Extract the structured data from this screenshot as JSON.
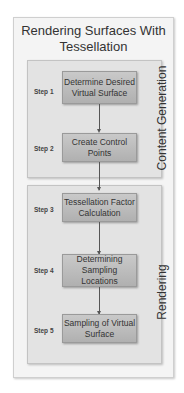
{
  "title": "Rendering Surfaces With Tessellation",
  "sections": [
    {
      "label": "Content Generation"
    },
    {
      "label": "Rendering"
    }
  ],
  "steps": [
    {
      "step": "Step 1",
      "label": "Determine Desired Virtual Surface"
    },
    {
      "step": "Step 2",
      "label": "Create Control Points"
    },
    {
      "step": "Step 3",
      "label": "Tessellation Factor Calculation"
    },
    {
      "step": "Step 4",
      "label": "Determining Sampling Locations"
    },
    {
      "step": "Step 5",
      "label": "Sampling of Virtual Surface"
    }
  ]
}
